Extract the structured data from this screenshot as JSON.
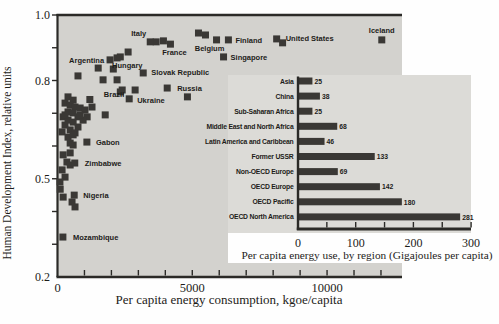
{
  "figure_description": "Scatter plot of Human Development Index vs per capita energy consumption by country, with inset horizontal bar chart of per capita energy use by region",
  "colors": {
    "page_bg": "#fefefe",
    "plot_bg": "#d3d2ce",
    "inset_bg": "#dcdbd7",
    "marker": "#3a3835",
    "bar": "#3a3835",
    "axis": "#2b2a27",
    "text": "#1d1c19"
  },
  "chart_data": [
    {
      "type": "scatter",
      "title": "",
      "xlabel": "Per capita energy consumption, kgoe/capita",
      "ylabel": "Human Development Index, relative units",
      "xlim": [
        0,
        12780
      ],
      "ylim": [
        0.2,
        1.0
      ],
      "x_minor_tick_step": 1000,
      "y_minor_tick_step": 0.1,
      "grid": false,
      "legend": "none",
      "marker_shape": "square",
      "xticks": [
        {
          "v": 0,
          "t": "0"
        },
        {
          "v": 5000,
          "t": "5000"
        },
        {
          "v": 10000,
          "t": "10000"
        }
      ],
      "yticks": [
        {
          "v": 1.0,
          "t": "1.0"
        },
        {
          "v": 0.8,
          "t": "0.8"
        },
        {
          "v": 0.5,
          "t": "0.5"
        },
        {
          "v": 0.2,
          "t": "0.2"
        }
      ],
      "labeled_points": [
        {
          "label": "Italy",
          "x": 3440,
          "y": 0.918,
          "anchor": "end",
          "dx": -4,
          "dy": -6
        },
        {
          "label": "France",
          "x": 4190,
          "y": 0.911,
          "anchor": "middle",
          "dx": 4,
          "dy": 11
        },
        {
          "label": "Belgium",
          "x": 5900,
          "y": 0.924,
          "anchor": "middle",
          "dx": -7,
          "dy": 11
        },
        {
          "label": "Finland",
          "x": 6340,
          "y": 0.924,
          "anchor": "start",
          "dx": 7,
          "dy": 3
        },
        {
          "label": "Singapore",
          "x": 6160,
          "y": 0.872,
          "anchor": "start",
          "dx": 7,
          "dy": 3
        },
        {
          "label": "United States",
          "x": 8130,
          "y": 0.927,
          "anchor": "start",
          "dx": 9,
          "dy": 2
        },
        {
          "label": "Iceland",
          "x": 12030,
          "y": 0.924,
          "anchor": "middle",
          "dx": 0,
          "dy": -7
        },
        {
          "label": "Argentina",
          "x": 1950,
          "y": 0.863,
          "anchor": "end",
          "dx": -6,
          "dy": 3
        },
        {
          "label": "Hungary",
          "x": 2330,
          "y": 0.872,
          "anchor": "middle",
          "dx": 7,
          "dy": 11
        },
        {
          "label": "Slovak Republic",
          "x": 3180,
          "y": 0.823,
          "anchor": "start",
          "dx": 8,
          "dy": 2
        },
        {
          "label": "Russia",
          "x": 4070,
          "y": 0.777,
          "anchor": "start",
          "dx": 10,
          "dy": 3
        },
        {
          "label": "Ukraine",
          "x": 2660,
          "y": 0.744,
          "anchor": "start",
          "dx": 8,
          "dy": 4
        },
        {
          "label": "Brazil",
          "x": 1200,
          "y": 0.742,
          "anchor": "start",
          "dx": 14,
          "dy": -2
        },
        {
          "label": "Gabon",
          "x": 1090,
          "y": 0.612,
          "anchor": "start",
          "dx": 9,
          "dy": 3
        },
        {
          "label": "Zimbabwe",
          "x": 640,
          "y": 0.548,
          "anchor": "start",
          "dx": 10,
          "dy": 3
        },
        {
          "label": "Nigeria",
          "x": 620,
          "y": 0.45,
          "anchor": "start",
          "dx": 9,
          "dy": 3
        },
        {
          "label": "Mozambique",
          "x": 200,
          "y": 0.322,
          "anchor": "start",
          "dx": 10,
          "dy": 3
        }
      ],
      "points": [
        [
          3660,
          0.918
        ],
        [
          3930,
          0.921
        ],
        [
          5230,
          0.945
        ],
        [
          5490,
          0.939
        ],
        [
          8350,
          0.915
        ],
        [
          2620,
          0.887
        ],
        [
          2210,
          0.869
        ],
        [
          2070,
          0.835
        ],
        [
          1510,
          0.838
        ],
        [
          760,
          0.814
        ],
        [
          1690,
          0.802
        ],
        [
          2210,
          0.802
        ],
        [
          2880,
          0.771
        ],
        [
          2330,
          0.765
        ],
        [
          2400,
          0.771
        ],
        [
          4820,
          0.75
        ],
        [
          1770,
          0.695
        ],
        [
          390,
          0.75
        ],
        [
          580,
          0.74
        ],
        [
          280,
          0.731
        ],
        [
          470,
          0.725
        ],
        [
          650,
          0.719
        ],
        [
          840,
          0.716
        ],
        [
          1020,
          0.71
        ],
        [
          1280,
          0.719
        ],
        [
          390,
          0.704
        ],
        [
          580,
          0.701
        ],
        [
          210,
          0.689
        ],
        [
          760,
          0.689
        ],
        [
          1100,
          0.689
        ],
        [
          390,
          0.679
        ],
        [
          950,
          0.679
        ],
        [
          580,
          0.673
        ],
        [
          280,
          0.695
        ],
        [
          840,
          0.695
        ],
        [
          280,
          0.664
        ],
        [
          760,
          0.658
        ],
        [
          470,
          0.649
        ],
        [
          170,
          0.643
        ],
        [
          650,
          0.64
        ],
        [
          390,
          0.627
        ],
        [
          580,
          0.634
        ],
        [
          470,
          0.609
        ],
        [
          580,
          0.603
        ],
        [
          210,
          0.573
        ],
        [
          470,
          0.579
        ],
        [
          350,
          0.551
        ],
        [
          470,
          0.542
        ],
        [
          170,
          0.527
        ],
        [
          280,
          0.505
        ],
        [
          90,
          0.49
        ],
        [
          100,
          0.468
        ],
        [
          210,
          0.444
        ],
        [
          540,
          0.429
        ],
        [
          650,
          0.414
        ]
      ]
    },
    {
      "type": "bar",
      "orientation": "horizontal",
      "title": "",
      "xlabel": "Per capita energy use, by region (Gigajoules per capita)",
      "xlim": [
        0,
        300
      ],
      "x_minor_tick_step": 50,
      "grid": false,
      "legend": "none",
      "xticks": [
        {
          "v": 0,
          "t": "0"
        },
        {
          "v": 100,
          "t": "100"
        },
        {
          "v": 200,
          "t": "200"
        },
        {
          "v": 300,
          "t": "300"
        }
      ],
      "categories": [
        "Asia",
        "China",
        "Sub-Saharan Africa",
        "Middle East and North Africa",
        "Latin America and Caribbean",
        "Former USSR",
        "Non-OECD Europe",
        "OECD Europe",
        "OECD Pacific",
        "OECD North America"
      ],
      "values": [
        25,
        38,
        25,
        68,
        46,
        133,
        69,
        142,
        180,
        281
      ],
      "value_labels": [
        "25",
        "38",
        "25",
        "68",
        "46",
        "133",
        "69",
        "142",
        "180",
        "281"
      ]
    }
  ]
}
